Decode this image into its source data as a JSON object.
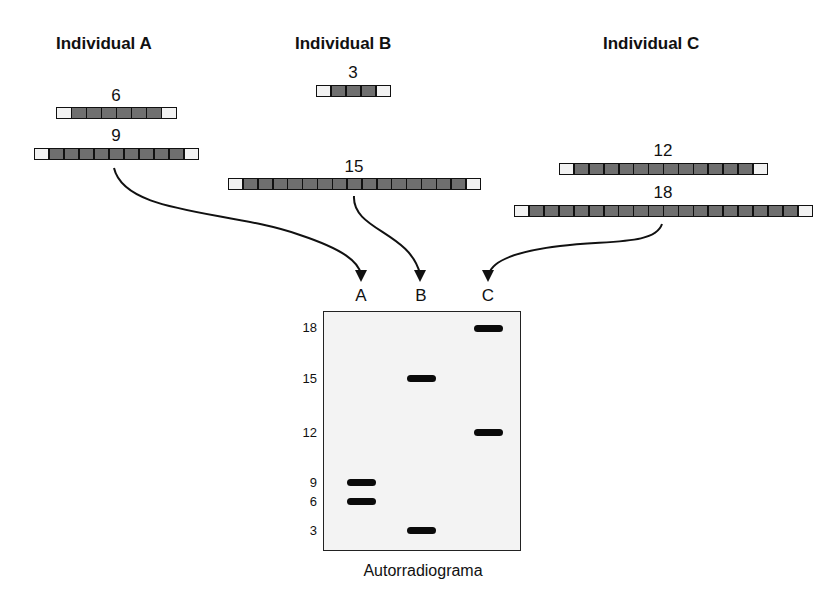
{
  "individuals": [
    {
      "label": "Individual A"
    },
    {
      "label": "Individual B"
    },
    {
      "label": "Individual C"
    }
  ],
  "alleles": [
    {
      "owner": "A",
      "repeats": "6"
    },
    {
      "owner": "A",
      "repeats": "9"
    },
    {
      "owner": "B",
      "repeats": "3"
    },
    {
      "owner": "B",
      "repeats": "15"
    },
    {
      "owner": "C",
      "repeats": "12"
    },
    {
      "owner": "C",
      "repeats": "18"
    }
  ],
  "gel": {
    "lanes": [
      "A",
      "B",
      "C"
    ],
    "size_markers": [
      "18",
      "15",
      "12",
      "9",
      "6",
      "3"
    ],
    "bands": [
      {
        "lane": "A",
        "size": 9
      },
      {
        "lane": "A",
        "size": 6
      },
      {
        "lane": "B",
        "size": 15
      },
      {
        "lane": "B",
        "size": 3
      },
      {
        "lane": "C",
        "size": 18
      },
      {
        "lane": "C",
        "size": 12
      }
    ],
    "caption": "Autorradiograma"
  },
  "colors": {
    "repeat_cell": "#6f6f6f",
    "flank_cell": "#f2f2f2",
    "band": "#0a0a0a",
    "gel_bg": "#f3f3f3"
  }
}
